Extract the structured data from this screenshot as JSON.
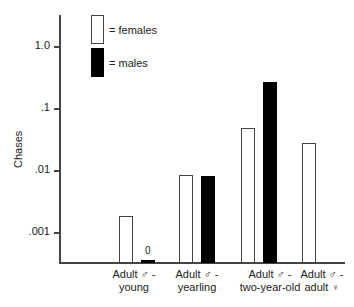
{
  "chart_data": {
    "type": "bar",
    "title": "",
    "xlabel": "",
    "ylabel": "Chases",
    "yscale": "log",
    "ylim": [
      0.0005,
      4
    ],
    "yticks": [
      "1.0",
      ".1",
      ".01",
      ".001"
    ],
    "categories": [
      {
        "line1": "Adult ♂ -",
        "line2": "young"
      },
      {
        "line1": "Adult ♂ -",
        "line2": "yearling"
      },
      {
        "line1": "Adult ♂ -",
        "line2": "two-year-old"
      },
      {
        "line1": "Adult ♂ -",
        "line2": "adult ♀"
      }
    ],
    "series": [
      {
        "name": "females",
        "color": "#ffffff",
        "values": [
          0.0018,
          0.0083,
          0.048,
          0.027
        ]
      },
      {
        "name": "males",
        "color": "#000000",
        "values": [
          0,
          0.008,
          0.26,
          null
        ]
      }
    ],
    "annotations": [
      {
        "text": "0",
        "category": 0,
        "series": "males"
      }
    ],
    "legend": [
      {
        "label": "= females",
        "fill": "#ffffff"
      },
      {
        "label": "= males",
        "fill": "#000000"
      }
    ],
    "legend_position": "top-left inside",
    "grid": false
  }
}
